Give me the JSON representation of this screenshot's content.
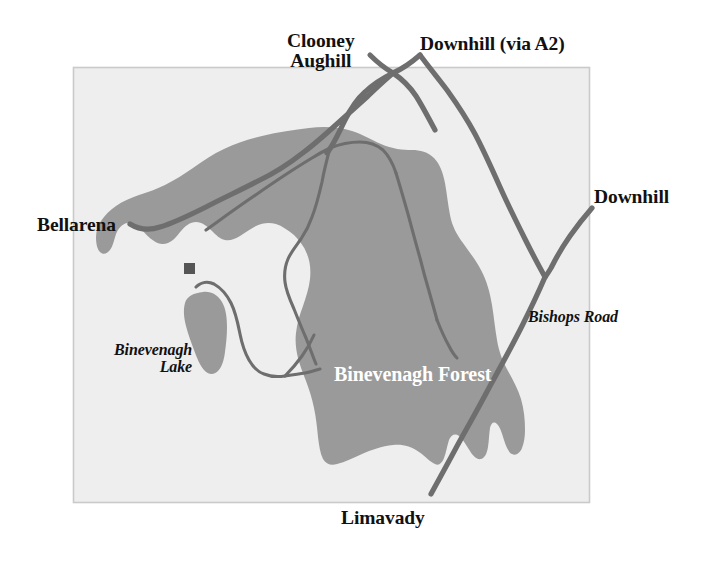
{
  "map": {
    "title": "Binevenagh Forest locality map",
    "frame": {
      "fill": "#eeeeee",
      "stroke": "#c9c9c9",
      "x": 73,
      "y": 67,
      "width": 517,
      "height": 436
    },
    "colors": {
      "forest_fill": "#9a9a9a",
      "lake_fill": "#9a9a9a",
      "road_stroke": "#6e6e6e",
      "forest_road_stroke": "#6e6e6e",
      "label_text": "#111111",
      "forest_label_text": "#ffffff",
      "marker_fill": "#555555",
      "background": "#ffffff"
    },
    "labels": [
      {
        "name": "clooney-aughill",
        "lines": [
          "Clooney",
          "Aughill"
        ],
        "text": "Clooney\nAughill",
        "style": "place",
        "x": 287,
        "y": 31
      },
      {
        "name": "downhill-via-a2",
        "lines": [
          "Downhill (via A2)"
        ],
        "text": "Downhill (via A2)",
        "style": "place",
        "x": 420,
        "y": 34
      },
      {
        "name": "downhill",
        "lines": [
          "Downhill"
        ],
        "text": "Downhill",
        "style": "place",
        "x": 594,
        "y": 187
      },
      {
        "name": "bellarena",
        "lines": [
          "Bellarena"
        ],
        "text": "Bellarena",
        "style": "place",
        "x": 37,
        "y": 215
      },
      {
        "name": "bishops-road",
        "lines": [
          "Bishops Road"
        ],
        "text": "Bishops Road",
        "style": "road",
        "x": 528,
        "y": 309
      },
      {
        "name": "binevenagh-lake",
        "lines": [
          "Binevenagh",
          "Lake"
        ],
        "text": "Binevenagh\nLake",
        "style": "lake",
        "x": 114,
        "y": 342
      },
      {
        "name": "binevenagh-forest",
        "lines": [
          "Binevenagh Forest"
        ],
        "text": "Binevenagh Forest",
        "style": "forest",
        "x": 334,
        "y": 364
      },
      {
        "name": "limavady",
        "lines": [
          "Limavady"
        ],
        "text": "Limavady",
        "style": "place",
        "x": 341,
        "y": 508
      }
    ],
    "marker": {
      "name": "site-marker",
      "x": 184,
      "y": 263,
      "size": 11
    },
    "features": {
      "forest_name": "Binevenagh Forest",
      "lake_name": "Binevenagh Lake",
      "road_names": [
        "Bishops Road"
      ],
      "destinations": [
        "Clooney Aughill",
        "Downhill (via A2)",
        "Downhill",
        "Bellarena",
        "Limavady"
      ]
    }
  }
}
